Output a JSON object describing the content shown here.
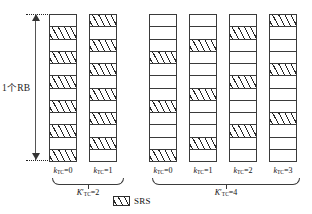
{
  "figure": {
    "rb_label": "1个RB",
    "cells_per_column": 12,
    "legend": {
      "swatch_name": "srs-hatch-swatch",
      "label": "SRS"
    },
    "groups": [
      {
        "id": "ktc2",
        "label_base": "K",
        "label_prime": "′",
        "label_sub": "TC",
        "label_eq": "=2",
        "columns": [
          {
            "label_base": "k",
            "label_sub": "TC",
            "label_eq": "=0",
            "srs_positions": [
              2,
              4,
              6,
              8,
              10,
              12
            ]
          },
          {
            "label_base": "k",
            "label_sub": "TC",
            "label_eq": "=1",
            "srs_positions": [
              1,
              3,
              5,
              7,
              9,
              11
            ]
          }
        ]
      },
      {
        "id": "ktc4",
        "label_base": "K",
        "label_prime": "′",
        "label_sub": "TC",
        "label_eq": "=4",
        "columns": [
          {
            "label_base": "k",
            "label_sub": "TC",
            "label_eq": "=0",
            "srs_positions": [
              4,
              8,
              12
            ]
          },
          {
            "label_base": "k",
            "label_sub": "TC",
            "label_eq": "=1",
            "srs_positions": [
              3,
              7,
              11
            ]
          },
          {
            "label_base": "k",
            "label_sub": "TC",
            "label_eq": "=2",
            "srs_positions": [
              2,
              6,
              10
            ]
          },
          {
            "label_base": "k",
            "label_sub": "TC",
            "label_eq": "=3",
            "srs_positions": [
              1,
              5,
              9
            ]
          }
        ]
      }
    ]
  },
  "layout": {
    "column_x": [
      49,
      89,
      149,
      189,
      229,
      269
    ],
    "column_top": 14,
    "group_brace": [
      {
        "left": 52,
        "width": 72,
        "tick_x": 88,
        "label_center": 88
      },
      {
        "left": 152,
        "width": 148,
        "tick_x": 226,
        "label_center": 226
      }
    ],
    "guides": [
      {
        "left": 26,
        "top": 14,
        "width": 24
      },
      {
        "left": 26,
        "top": 160,
        "width": 24
      }
    ]
  }
}
